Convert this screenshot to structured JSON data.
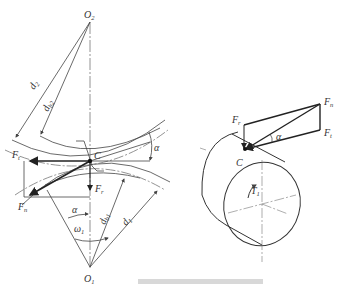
{
  "left_diagram": {
    "labels": {
      "O2": "O",
      "O2_sub": "2",
      "O1": "O",
      "O1_sub": "1",
      "C": "C",
      "d2": "d",
      "d2_sub": "2",
      "db2": "d",
      "db2_sub": "b2",
      "d1": "d",
      "d1_sub": "1",
      "db1": "d",
      "db1_sub": "b1",
      "Ft": "F",
      "Ft_sub": "t",
      "Fr": "F",
      "Fr_sub": "r",
      "Fn": "F",
      "Fn_sub": "n",
      "alpha_top": "α",
      "alpha_bottom": "α",
      "omega1": "ω",
      "omega1_sub": "1"
    }
  },
  "right_diagram": {
    "labels": {
      "Fr": "F",
      "Fr_sub": "r",
      "Fn": "F",
      "Fn_sub": "n",
      "Ft": "F",
      "Ft_sub": "t",
      "alpha": "α",
      "C": "C",
      "T1": "T",
      "T1_sub": "1"
    }
  },
  "colors": {
    "line": "#333333",
    "thick": "#222222",
    "center": "#777777"
  }
}
